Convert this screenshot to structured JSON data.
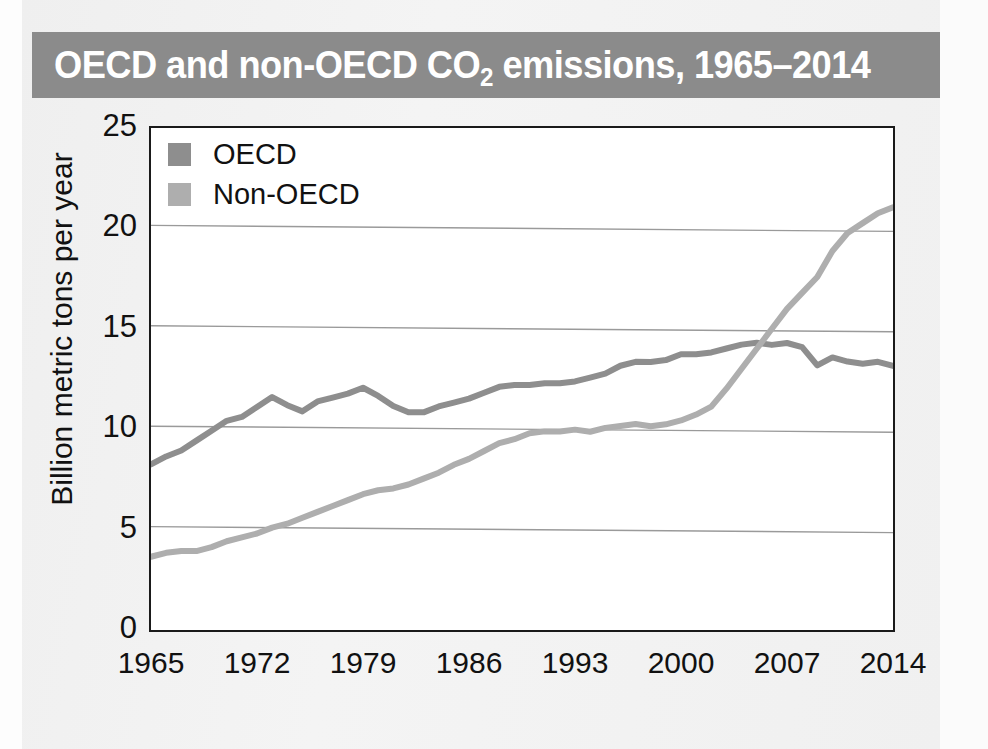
{
  "figure": {
    "title_main": "OECD and non-OECD CO",
    "title_sub": "2",
    "title_tail": " emissions, 1965–2014",
    "banner_color": "#8b8b8b",
    "panel_color": "#f1f1f1"
  },
  "legend": {
    "position": "top-left-inside",
    "entries": [
      {
        "label": "OECD",
        "color": "#8e8e8e"
      },
      {
        "label": "Non-OECD",
        "color": "#aeaeae"
      }
    ]
  },
  "axes": {
    "ylabel": "Billion metric tons per year",
    "xlabel": "",
    "yticks": [
      "25",
      "20",
      "15",
      "10",
      "5",
      "0"
    ],
    "xticks": [
      "1965",
      "1972",
      "1979",
      "1986",
      "1993",
      "2000",
      "2007",
      "2014"
    ]
  },
  "chart_data": {
    "type": "line",
    "title": "OECD and non-OECD CO2 emissions, 1965–2014",
    "xlabel": "",
    "ylabel": "Billion metric tons per year",
    "xlim": [
      1965,
      2014
    ],
    "ylim": [
      0,
      25
    ],
    "ytick_values": [
      0,
      5,
      10,
      15,
      20,
      25
    ],
    "xtick_values": [
      1965,
      1972,
      1979,
      1986,
      1993,
      2000,
      2007,
      2014
    ],
    "grid": "horizontal",
    "legend_position": "upper left",
    "x": [
      1965,
      1966,
      1967,
      1968,
      1969,
      1970,
      1971,
      1972,
      1973,
      1974,
      1975,
      1976,
      1977,
      1978,
      1979,
      1980,
      1981,
      1982,
      1983,
      1984,
      1985,
      1986,
      1987,
      1988,
      1989,
      1990,
      1991,
      1992,
      1993,
      1994,
      1995,
      1996,
      1997,
      1998,
      1999,
      2000,
      2001,
      2002,
      2003,
      2004,
      2005,
      2006,
      2007,
      2008,
      2009,
      2010,
      2011,
      2012,
      2013,
      2014
    ],
    "series": [
      {
        "name": "OECD",
        "color": "#8e8e8e",
        "values": [
          8.1,
          8.5,
          8.8,
          9.3,
          9.8,
          10.3,
          10.5,
          11.0,
          11.5,
          11.1,
          10.8,
          11.3,
          11.5,
          11.7,
          12.0,
          11.6,
          11.1,
          10.8,
          10.8,
          11.1,
          11.3,
          11.5,
          11.8,
          12.1,
          12.2,
          12.2,
          12.3,
          12.3,
          12.4,
          12.6,
          12.8,
          13.2,
          13.4,
          13.4,
          13.5,
          13.8,
          13.8,
          13.9,
          14.1,
          14.3,
          14.4,
          14.3,
          14.4,
          14.2,
          13.3,
          13.7,
          13.5,
          13.4,
          13.5,
          13.3
        ]
      },
      {
        "name": "Non-OECD",
        "color": "#aeaeae",
        "values": [
          3.5,
          3.7,
          3.8,
          3.8,
          4.0,
          4.3,
          4.5,
          4.7,
          5.0,
          5.2,
          5.5,
          5.8,
          6.1,
          6.4,
          6.7,
          6.9,
          7.0,
          7.2,
          7.5,
          7.8,
          8.2,
          8.5,
          8.9,
          9.3,
          9.5,
          9.8,
          9.9,
          9.9,
          10.0,
          9.9,
          10.1,
          10.2,
          10.3,
          10.2,
          10.3,
          10.5,
          10.8,
          11.2,
          12.1,
          13.1,
          14.1,
          15.1,
          16.1,
          16.9,
          17.7,
          19.0,
          19.9,
          20.4,
          20.9,
          21.2
        ]
      }
    ]
  }
}
